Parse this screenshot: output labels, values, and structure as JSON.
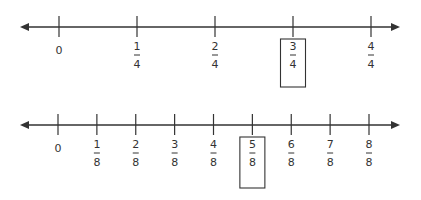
{
  "number_lines": [
    {
      "name": "fourths",
      "start": 0,
      "end": 1,
      "labels": [
        {
          "value": 0,
          "whole": "0"
        },
        {
          "value": 0.25,
          "num": "1",
          "den": "4"
        },
        {
          "value": 0.5,
          "num": "2",
          "den": "4"
        },
        {
          "value": 0.75,
          "num": "3",
          "den": "4",
          "boxed": true
        },
        {
          "value": 1,
          "num": "4",
          "den": "4"
        }
      ]
    },
    {
      "name": "eighths",
      "start": 0,
      "end": 1,
      "labels": [
        {
          "value": 0,
          "whole": "0"
        },
        {
          "value": 0.125,
          "num": "1",
          "den": "8"
        },
        {
          "value": 0.25,
          "num": "2",
          "den": "8"
        },
        {
          "value": 0.375,
          "num": "3",
          "den": "8"
        },
        {
          "value": 0.5,
          "num": "4",
          "den": "8"
        },
        {
          "value": 0.625,
          "num": "5",
          "den": "8",
          "boxed": true
        },
        {
          "value": 0.75,
          "num": "6",
          "den": "8"
        },
        {
          "value": 0.875,
          "num": "7",
          "den": "8"
        },
        {
          "value": 1,
          "num": "8",
          "den": "8"
        }
      ]
    }
  ],
  "colors": {
    "line": "#333333",
    "text": "#333333"
  }
}
